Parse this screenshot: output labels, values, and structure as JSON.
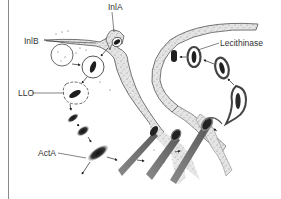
{
  "figure": {
    "labels": {
      "inla": "InlA",
      "inlb": "InlB",
      "llo": "LLO",
      "acta": "ActA",
      "lecithinase": "Lecithinase"
    },
    "colors": {
      "background": "#ffffff",
      "cytoplasm_stipple": "#bdbdbd",
      "membrane_outline": "#555555",
      "bacterium_dark": "#1e1e1e",
      "actin_tail": "#6e6e6e",
      "text": "#333333",
      "frame_line": "#8a8a8a"
    }
  }
}
